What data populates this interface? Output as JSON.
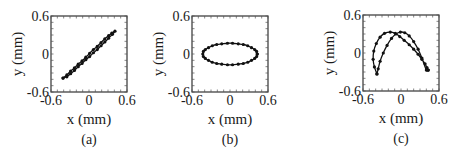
{
  "chart_data": [
    {
      "type": "line",
      "panel": "(a)",
      "title": "",
      "xlabel": "x (mm)",
      "ylabel": "y (mm)",
      "xlim": [
        -0.6,
        0.6
      ],
      "ylim": [
        -0.6,
        0.6
      ],
      "xticks": [
        "-0.6",
        "0",
        "0.6"
      ],
      "yticks": [
        "0.6",
        "0",
        "-0.6"
      ],
      "minor_tick_step": 0.1,
      "grid": false,
      "markers": true,
      "shape": "narrow loop along diagonal",
      "series": [
        {
          "name": "trajectory",
          "x": [
            -0.41,
            -0.35,
            -0.29,
            -0.23,
            -0.17,
            -0.11,
            -0.05,
            0.01,
            0.07,
            0.13,
            0.19,
            0.25,
            0.31,
            0.36,
            0.41,
            0.37,
            0.31,
            0.25,
            0.19,
            0.13,
            0.07,
            0.01,
            -0.05,
            -0.11,
            -0.17,
            -0.23,
            -0.29,
            -0.35,
            -0.41
          ],
          "y": [
            -0.38,
            -0.33,
            -0.27,
            -0.22,
            -0.16,
            -0.11,
            -0.05,
            0.01,
            0.07,
            0.12,
            0.18,
            0.24,
            0.29,
            0.33,
            0.36,
            0.31,
            0.25,
            0.19,
            0.13,
            0.07,
            0.02,
            -0.04,
            -0.09,
            -0.15,
            -0.2,
            -0.26,
            -0.31,
            -0.36,
            -0.38
          ]
        }
      ]
    },
    {
      "type": "line",
      "panel": "(b)",
      "title": "",
      "xlabel": "x (mm)",
      "ylabel": "y (mm)",
      "xlim": [
        -0.6,
        0.6
      ],
      "ylim": [
        -0.6,
        0.6
      ],
      "xticks": [
        "-0.6",
        "0",
        "0.6"
      ],
      "yticks": [
        "0.6",
        "0",
        "-0.6"
      ],
      "minor_tick_step": 0.1,
      "grid": false,
      "markers": true,
      "shape": "ellipse",
      "series": [
        {
          "name": "trajectory",
          "x": [
            0.43,
            0.42,
            0.39,
            0.34,
            0.28,
            0.21,
            0.13,
            0.04,
            -0.04,
            -0.13,
            -0.21,
            -0.28,
            -0.34,
            -0.39,
            -0.42,
            -0.43,
            -0.42,
            -0.39,
            -0.34,
            -0.28,
            -0.21,
            -0.13,
            -0.04,
            0.04,
            0.13,
            0.21,
            0.28,
            0.34,
            0.39,
            0.42,
            0.43
          ],
          "y": [
            0.0,
            0.04,
            0.07,
            0.1,
            0.13,
            0.15,
            0.16,
            0.17,
            0.17,
            0.16,
            0.15,
            0.13,
            0.1,
            0.07,
            0.04,
            0.0,
            -0.04,
            -0.07,
            -0.1,
            -0.13,
            -0.15,
            -0.16,
            -0.17,
            -0.17,
            -0.16,
            -0.15,
            -0.13,
            -0.1,
            -0.07,
            -0.04,
            0.0
          ]
        }
      ]
    },
    {
      "type": "line",
      "panel": "(c)",
      "title": "",
      "xlabel": "x (mm)",
      "ylabel": "y (mm)",
      "xlim": [
        -0.6,
        0.6
      ],
      "ylim": [
        -0.6,
        0.6
      ],
      "xticks": [
        "-0.6",
        "0",
        "0.6"
      ],
      "yticks": [
        "0.6",
        "0",
        "-0.6"
      ],
      "minor_tick_step": 0.1,
      "grid": false,
      "markers": true,
      "shape": "figure-eight / crossing double arch",
      "series": [
        {
          "name": "trajectory",
          "x": [
            -0.38,
            -0.42,
            -0.44,
            -0.43,
            -0.39,
            -0.33,
            -0.26,
            -0.17,
            -0.09,
            -0.02,
            0.05,
            0.13,
            0.2,
            0.27,
            0.33,
            0.38,
            0.41,
            0.43,
            0.43,
            0.4,
            0.33,
            0.27,
            0.2,
            0.13,
            0.06,
            -0.01,
            -0.08,
            -0.15,
            -0.22,
            -0.28,
            -0.33,
            -0.36,
            -0.38
          ],
          "y": [
            -0.33,
            -0.22,
            -0.1,
            0.03,
            0.15,
            0.25,
            0.31,
            0.33,
            0.31,
            0.26,
            0.2,
            0.13,
            0.06,
            -0.02,
            -0.1,
            -0.17,
            -0.23,
            -0.27,
            -0.27,
            -0.27,
            -0.08,
            0.06,
            0.18,
            0.27,
            0.32,
            0.33,
            0.3,
            0.23,
            0.12,
            0.0,
            -0.13,
            -0.25,
            -0.33
          ]
        }
      ]
    }
  ],
  "captions": [
    "(a)",
    "(b)",
    "(c)"
  ]
}
